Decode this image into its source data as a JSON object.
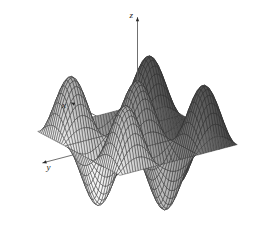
{
  "figure": {
    "title": "",
    "background_color": "#ffffff",
    "type": "3d-surface-mesh"
  },
  "axes": {
    "x": {
      "label": "x",
      "arrow": "arrow-head",
      "direction": "left-down"
    },
    "y": {
      "label": "y",
      "arrow": "arrow-head",
      "direction": "right-down"
    },
    "z": {
      "label": "z",
      "arrow": "arrow-head",
      "direction": "up"
    }
  },
  "chart_data": {
    "type": "surface",
    "title": "",
    "xlabel": "x",
    "ylabel": "y",
    "zlabel": "z",
    "function": "cos(x)*cos(y)",
    "xlim": [
      -4.71238898,
      4.71238898
    ],
    "ylim": [
      -4.71238898,
      4.71238898
    ],
    "zlim": [
      -1,
      1
    ],
    "grid": true,
    "legend": null,
    "samples": 46,
    "peaks": [
      {
        "name": "center-peak",
        "x": 0.0,
        "y": 0.0,
        "z": 1.0,
        "shade": "dark"
      },
      {
        "name": "front-peak",
        "x": 0.0,
        "y": 3.14159265,
        "z": 1.0,
        "shade": "light"
      },
      {
        "name": "back-peak",
        "x": 0.0,
        "y": -3.14159265,
        "z": 1.0,
        "shade": "hidden"
      },
      {
        "name": "left-peak",
        "x": -3.14159265,
        "y": 0.0,
        "z": 1.0,
        "shade": "medium"
      },
      {
        "name": "right-peak",
        "x": 3.14159265,
        "y": 0.0,
        "z": 1.0,
        "shade": "medium"
      },
      {
        "name": "corner-peak-1",
        "x": -3.14159265,
        "y": 3.14159265,
        "z": 1.0,
        "shade": "medium"
      },
      {
        "name": "corner-peak-2",
        "x": 3.14159265,
        "y": 3.14159265,
        "z": 1.0,
        "shade": "medium"
      }
    ],
    "valleys": [
      {
        "name": "valley-front-left",
        "x": -1.57079633,
        "y": 1.57079633,
        "z": -1.0
      },
      {
        "name": "valley-front-right",
        "x": 1.57079633,
        "y": 1.57079633,
        "z": -1.0
      },
      {
        "name": "valley-back-left",
        "x": -1.57079633,
        "y": -1.57079633,
        "z": -1.0
      },
      {
        "name": "valley-back-right",
        "x": 1.57079633,
        "y": -1.57079633,
        "z": -1.0
      }
    ],
    "colormap": {
      "shading": "grayscale-height",
      "dark": "#3f3f3f",
      "medium": "#8c8c8c",
      "light": "#dcdcdc",
      "mesh_line": "#2b2b2b"
    },
    "view": {
      "elevation": 22,
      "azimuth": -55
    }
  },
  "style": {
    "mesh_line_color": "#303030",
    "axis_line_color": "#606060",
    "background": "#ffffff"
  }
}
